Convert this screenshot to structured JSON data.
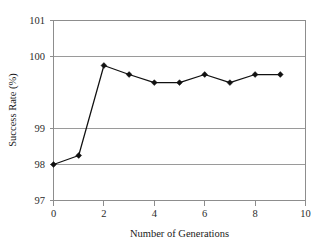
{
  "chart_data": {
    "type": "line",
    "title": "",
    "xlabel": "Number of Generations",
    "ylabel": "Success Rate (%)",
    "xlim": [
      0,
      10
    ],
    "ylim": [
      97,
      101
    ],
    "xticks": [
      0,
      2,
      4,
      6,
      8,
      10
    ],
    "xtick_labels": [
      "0",
      "2",
      "4",
      "6",
      "8",
      "10"
    ],
    "yticks": [
      97,
      98,
      99,
      100,
      101
    ],
    "ytick_labels": [
      "97",
      "98",
      "99",
      "100",
      "101"
    ],
    "grid": "horizontal",
    "legend": "none",
    "x": [
      0,
      1,
      2,
      3,
      4,
      5,
      6,
      7,
      8,
      9
    ],
    "values": [
      97.8,
      98.0,
      100.0,
      99.8,
      99.62,
      99.62,
      99.8,
      99.62,
      99.8,
      99.8
    ],
    "series": [
      {
        "name": "Success Rate",
        "marker": "diamond",
        "line_color": "#111111",
        "marker_color": "#111111",
        "values": [
          97.8,
          98.0,
          100.0,
          99.8,
          99.62,
          99.62,
          99.8,
          99.62,
          99.8,
          99.8
        ]
      }
    ],
    "colors": {
      "background": "#ffffff",
      "grid": "#9a9a9a",
      "frame": "#8d8d8d",
      "series": "#111111",
      "text": "#1a1a1a"
    }
  }
}
